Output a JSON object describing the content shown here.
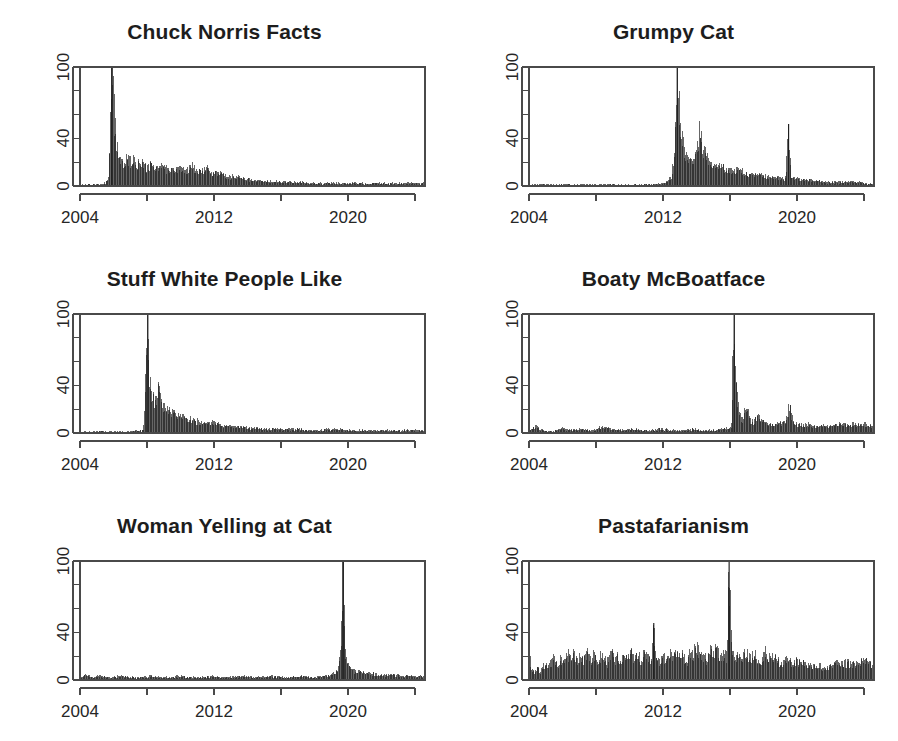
{
  "figure": {
    "layout": "2 columns x 3 rows",
    "background_color": "#ffffff",
    "ink_color": "#1d1d1d",
    "axis_color": "#4a4a4a"
  },
  "chart_data": [
    {
      "type": "area",
      "title": "Chuck Norris Facts",
      "xlabel": "",
      "ylabel": "",
      "xlim": [
        2004,
        2024.6
      ],
      "ylim": [
        0,
        100
      ],
      "yticks": [
        0,
        20,
        40,
        60,
        80,
        100
      ],
      "ytick_labels": [
        "0",
        "",
        "40",
        "",
        "",
        "100"
      ],
      "xticks": [
        2004,
        2008,
        2012,
        2016,
        2020,
        2024
      ],
      "xtick_labels": [
        "2004",
        "",
        "2012",
        "",
        "2020",
        ""
      ],
      "grid": false,
      "legend": "none",
      "x": [
        2004.0,
        2004.3,
        2004.6,
        2004.9,
        2005.2,
        2005.5,
        2005.7,
        2005.8,
        2005.9,
        2006.0,
        2006.1,
        2006.2,
        2006.3,
        2006.45,
        2006.6,
        2006.8,
        2007.0,
        2007.2,
        2007.4,
        2007.6,
        2007.8,
        2008.0,
        2008.3,
        2008.6,
        2008.9,
        2009.2,
        2009.5,
        2009.8,
        2010.1,
        2010.4,
        2010.7,
        2011.0,
        2011.3,
        2011.6,
        2011.9,
        2012.2,
        2012.5,
        2012.8,
        2013.2,
        2013.6,
        2014.0,
        2014.5,
        2015.0,
        2015.5,
        2016.0,
        2017.0,
        2018.0,
        2019.0,
        2020.0,
        2021.0,
        2022.0,
        2023.0,
        2024.0,
        2024.6
      ],
      "values": [
        1,
        1,
        1,
        1,
        1,
        2,
        8,
        40,
        100,
        72,
        45,
        30,
        24,
        20,
        17,
        22,
        19,
        21,
        16,
        20,
        17,
        15,
        18,
        14,
        16,
        13,
        15,
        12,
        14,
        13,
        15,
        11,
        12,
        14,
        10,
        11,
        9,
        8,
        7,
        6,
        5,
        4,
        4,
        3,
        3,
        3,
        2,
        2,
        2,
        2,
        2,
        2,
        2,
        2
      ],
      "peak": {
        "x": 2005.9,
        "y": 100
      }
    },
    {
      "type": "area",
      "title": "Grumpy Cat",
      "xlabel": "",
      "ylabel": "",
      "xlim": [
        2004,
        2024.6
      ],
      "ylim": [
        0,
        100
      ],
      "yticks": [
        0,
        20,
        40,
        60,
        80,
        100
      ],
      "ytick_labels": [
        "0",
        "",
        "40",
        "",
        "",
        "100"
      ],
      "xticks": [
        2004,
        2008,
        2012,
        2016,
        2020,
        2024
      ],
      "xtick_labels": [
        "2004",
        "",
        "2012",
        "",
        "2020",
        ""
      ],
      "grid": false,
      "legend": "none",
      "x": [
        2004.0,
        2005.0,
        2006.0,
        2007.0,
        2008.0,
        2009.0,
        2010.0,
        2011.0,
        2012.0,
        2012.5,
        2012.7,
        2012.85,
        2012.95,
        2013.05,
        2013.15,
        2013.3,
        2013.45,
        2013.6,
        2013.8,
        2014.0,
        2014.2,
        2014.4,
        2014.6,
        2014.8,
        2015.0,
        2015.3,
        2015.6,
        2015.9,
        2016.2,
        2016.5,
        2016.8,
        2017.2,
        2017.6,
        2018.0,
        2018.5,
        2019.0,
        2019.35,
        2019.5,
        2019.65,
        2019.9,
        2020.3,
        2020.8,
        2021.4,
        2022.0,
        2022.8,
        2023.5,
        2024.2,
        2024.6
      ],
      "values": [
        1,
        1,
        1,
        1,
        1,
        1,
        1,
        1,
        2,
        6,
        28,
        100,
        62,
        42,
        35,
        28,
        24,
        22,
        20,
        26,
        44,
        30,
        22,
        20,
        18,
        16,
        15,
        13,
        12,
        14,
        11,
        10,
        9,
        8,
        7,
        6,
        6,
        52,
        7,
        6,
        5,
        4,
        4,
        3,
        3,
        3,
        2,
        2
      ],
      "peak": {
        "x": 2012.85,
        "y": 100
      },
      "secondary_peak": {
        "x": 2019.5,
        "y": 52
      }
    },
    {
      "type": "area",
      "title": "Stuff White People Like",
      "xlabel": "",
      "ylabel": "",
      "xlim": [
        2004,
        2024.6
      ],
      "ylim": [
        0,
        100
      ],
      "yticks": [
        0,
        20,
        40,
        60,
        80,
        100
      ],
      "ytick_labels": [
        "0",
        "",
        "40",
        "",
        "",
        "100"
      ],
      "xticks": [
        2004,
        2008,
        2012,
        2016,
        2020,
        2024
      ],
      "xtick_labels": [
        "2004",
        "",
        "2012",
        "",
        "2020",
        ""
      ],
      "grid": false,
      "legend": "none",
      "x": [
        2004.0,
        2005.0,
        2006.0,
        2007.0,
        2007.8,
        2008.05,
        2008.15,
        2008.25,
        2008.4,
        2008.55,
        2008.7,
        2008.85,
        2009.0,
        2009.2,
        2009.4,
        2009.6,
        2009.8,
        2010.0,
        2010.3,
        2010.6,
        2010.9,
        2011.2,
        2011.5,
        2011.8,
        2012.2,
        2012.6,
        2013.0,
        2013.5,
        2014.0,
        2014.6,
        2015.2,
        2016.0,
        2017.0,
        2018.0,
        2019.0,
        2020.0,
        2021.0,
        2022.0,
        2023.0,
        2024.0,
        2024.6
      ],
      "values": [
        1,
        1,
        1,
        1,
        2,
        100,
        46,
        32,
        27,
        25,
        36,
        24,
        21,
        19,
        17,
        15,
        14,
        13,
        12,
        11,
        10,
        9,
        8,
        8,
        7,
        6,
        5,
        5,
        4,
        4,
        3,
        3,
        3,
        2,
        3,
        2,
        2,
        2,
        2,
        2,
        2
      ],
      "peak": {
        "x": 2008.05,
        "y": 100
      }
    },
    {
      "type": "area",
      "title": "Boaty McBoatface",
      "xlabel": "",
      "ylabel": "",
      "xlim": [
        2004,
        2024.6
      ],
      "ylim": [
        0,
        100
      ],
      "yticks": [
        0,
        20,
        40,
        60,
        80,
        100
      ],
      "ytick_labels": [
        "0",
        "",
        "40",
        "",
        "",
        "100"
      ],
      "xticks": [
        2004,
        2008,
        2012,
        2016,
        2020,
        2024
      ],
      "xtick_labels": [
        "2004",
        "",
        "2012",
        "",
        "2020",
        ""
      ],
      "grid": false,
      "legend": "none",
      "x": [
        2004.0,
        2004.4,
        2004.8,
        2005.4,
        2006.0,
        2006.6,
        2007.2,
        2007.8,
        2008.4,
        2009.0,
        2009.6,
        2010.2,
        2010.8,
        2011.4,
        2012.0,
        2012.6,
        2013.2,
        2013.8,
        2014.4,
        2015.0,
        2015.6,
        2016.1,
        2016.25,
        2016.35,
        2016.5,
        2016.65,
        2016.8,
        2017.0,
        2017.2,
        2017.4,
        2017.7,
        2018.0,
        2018.3,
        2018.6,
        2019.0,
        2019.3,
        2019.55,
        2019.8,
        2020.2,
        2020.6,
        2021.0,
        2021.5,
        2022.0,
        2022.6,
        2023.2,
        2023.8,
        2024.3,
        2024.6
      ],
      "values": [
        1,
        6,
        2,
        1,
        4,
        2,
        3,
        2,
        5,
        3,
        2,
        3,
        2,
        2,
        3,
        2,
        2,
        3,
        2,
        2,
        3,
        4,
        100,
        42,
        22,
        13,
        9,
        26,
        11,
        8,
        14,
        9,
        7,
        6,
        8,
        7,
        22,
        8,
        6,
        7,
        5,
        6,
        5,
        7,
        6,
        8,
        6,
        5
      ],
      "peak": {
        "x": 2016.25,
        "y": 100
      }
    },
    {
      "type": "area",
      "title": "Woman Yelling at Cat",
      "xlabel": "",
      "ylabel": "",
      "xlim": [
        2004,
        2024.6
      ],
      "ylim": [
        0,
        100
      ],
      "yticks": [
        0,
        20,
        40,
        60,
        80,
        100
      ],
      "ytick_labels": [
        "0",
        "",
        "40",
        "",
        "",
        "100"
      ],
      "xticks": [
        2004,
        2008,
        2012,
        2016,
        2020,
        2024
      ],
      "xtick_labels": [
        "2004",
        "",
        "2012",
        "",
        "2020",
        ""
      ],
      "grid": false,
      "legend": "none",
      "x": [
        2004.0,
        2004.3,
        2004.7,
        2005.2,
        2005.8,
        2006.4,
        2007.0,
        2007.6,
        2008.2,
        2008.8,
        2009.4,
        2010.0,
        2010.6,
        2011.2,
        2011.8,
        2012.4,
        2013.0,
        2013.6,
        2014.2,
        2014.8,
        2015.4,
        2016.0,
        2016.6,
        2017.2,
        2017.8,
        2018.4,
        2019.0,
        2019.4,
        2019.6,
        2019.72,
        2019.85,
        2020.0,
        2020.2,
        2020.5,
        2020.9,
        2021.4,
        2022.0,
        2022.6,
        2023.2,
        2023.8,
        2024.3,
        2024.6
      ],
      "values": [
        2,
        4,
        2,
        3,
        2,
        3,
        2,
        2,
        3,
        2,
        2,
        3,
        2,
        2,
        3,
        2,
        2,
        3,
        2,
        2,
        3,
        2,
        2,
        3,
        2,
        3,
        4,
        8,
        24,
        100,
        22,
        12,
        9,
        7,
        6,
        5,
        4,
        4,
        3,
        3,
        3,
        3
      ],
      "peak": {
        "x": 2019.72,
        "y": 100
      }
    },
    {
      "type": "area",
      "title": "Pastafarianism",
      "xlabel": "",
      "ylabel": "",
      "xlim": [
        2004,
        2024.6
      ],
      "ylim": [
        0,
        100
      ],
      "yticks": [
        0,
        20,
        40,
        60,
        80,
        100
      ],
      "ytick_labels": [
        "0",
        "",
        "40",
        "",
        "",
        "100"
      ],
      "xticks": [
        2004,
        2008,
        2012,
        2016,
        2020,
        2024
      ],
      "xtick_labels": [
        "2004",
        "",
        "2012",
        "",
        "2020",
        ""
      ],
      "grid": false,
      "legend": "none",
      "x": [
        2004.0,
        2004.15,
        2004.3,
        2004.5,
        2004.7,
        2004.9,
        2005.1,
        2005.3,
        2005.5,
        2005.7,
        2005.9,
        2006.1,
        2006.3,
        2006.5,
        2006.7,
        2006.9,
        2007.1,
        2007.3,
        2007.5,
        2007.7,
        2007.9,
        2008.1,
        2008.3,
        2008.5,
        2008.7,
        2008.9,
        2009.1,
        2009.3,
        2009.5,
        2009.7,
        2009.9,
        2010.1,
        2010.3,
        2010.5,
        2010.7,
        2010.9,
        2011.1,
        2011.3,
        2011.45,
        2011.6,
        2011.8,
        2012.0,
        2012.2,
        2012.4,
        2012.6,
        2012.8,
        2013.0,
        2013.2,
        2013.4,
        2013.6,
        2013.8,
        2014.0,
        2014.2,
        2014.4,
        2014.6,
        2014.8,
        2015.0,
        2015.2,
        2015.4,
        2015.6,
        2015.8,
        2015.95,
        2016.1,
        2016.3,
        2016.5,
        2016.7,
        2016.9,
        2017.2,
        2017.5,
        2017.8,
        2018.1,
        2018.4,
        2018.7,
        2019.0,
        2019.4,
        2019.8,
        2020.2,
        2020.6,
        2021.0,
        2021.5,
        2022.0,
        2022.5,
        2023.0,
        2023.5,
        2024.0,
        2024.3,
        2024.6
      ],
      "values": [
        24,
        8,
        6,
        9,
        7,
        12,
        10,
        14,
        18,
        11,
        16,
        13,
        20,
        15,
        22,
        14,
        19,
        16,
        23,
        17,
        20,
        15,
        21,
        18,
        14,
        22,
        16,
        19,
        13,
        21,
        17,
        24,
        15,
        20,
        16,
        22,
        18,
        14,
        48,
        17,
        13,
        19,
        15,
        22,
        17,
        26,
        16,
        20,
        14,
        23,
        18,
        30,
        17,
        21,
        15,
        24,
        19,
        27,
        16,
        22,
        18,
        100,
        26,
        17,
        21,
        14,
        23,
        18,
        20,
        15,
        22,
        17,
        19,
        14,
        16,
        13,
        15,
        11,
        12,
        10,
        11,
        13,
        14,
        12,
        15,
        13,
        11
      ],
      "peak": {
        "x": 2015.95,
        "y": 100
      },
      "secondary_peak": {
        "x": 2011.45,
        "y": 48
      }
    }
  ]
}
